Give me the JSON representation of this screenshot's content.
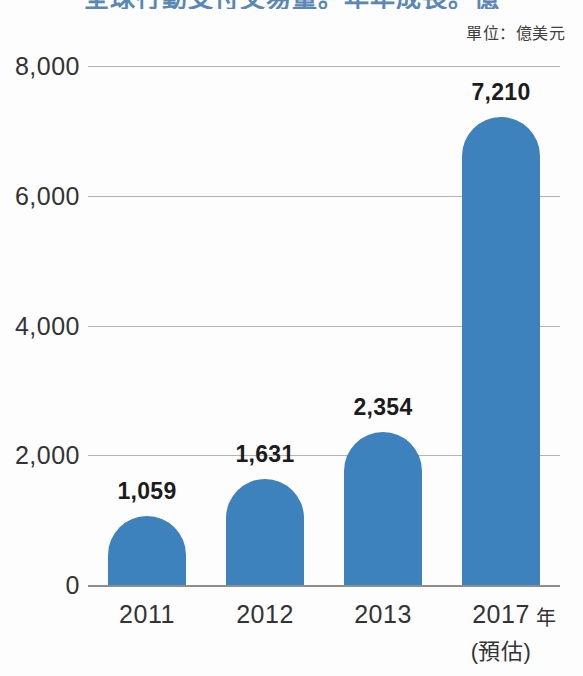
{
  "figure": {
    "title_clipped": "全球行動支付交易量。年年成長。億",
    "unit_caption": "單位：億美元",
    "axis_title_x": "年"
  },
  "colors": {
    "bar": "#3d81bd",
    "gridline": "#b4b4b4",
    "baseline": "#8d8d8d",
    "background": "#fdfdfd",
    "title": "#5b87b5"
  },
  "chart_data": {
    "type": "bar",
    "title": "全球行動支付交易量。年年成長。億",
    "subtitle": "單位：億美元",
    "xlabel": "年",
    "ylabel": "",
    "categories": [
      "2011",
      "2012",
      "2013",
      "2017"
    ],
    "category_sublabels": [
      "",
      "",
      "",
      "(預估)"
    ],
    "values": [
      1059,
      1631,
      2354,
      7210
    ],
    "value_labels": [
      "1,059",
      "1,631",
      "2,354",
      "7,210"
    ],
    "ylim": [
      0,
      8000
    ],
    "yticks": [
      0,
      2000,
      4000,
      6000,
      8000
    ],
    "ytick_labels": [
      "0",
      "2,000",
      "4,000",
      "6,000",
      "8,000"
    ],
    "grid": true,
    "legend": null,
    "series": [
      {
        "name": "交易量",
        "values": [
          1059,
          1631,
          2354,
          7210
        ]
      }
    ]
  }
}
